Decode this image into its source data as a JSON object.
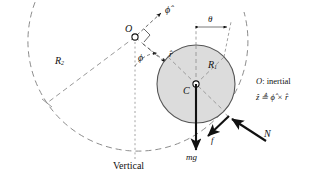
{
  "figure": {
    "type": "free-body-diagram",
    "background": "#ffffff",
    "ink": "#111111",
    "disk_fill": "#dcdcdc",
    "disk_stroke": "#555555",
    "dash_stroke": "#8c8c8c"
  },
  "points": {
    "O": {
      "label": "O",
      "x": 135,
      "y": 37,
      "note": "pivot / inertial origin"
    },
    "C": {
      "label": "C",
      "x": 196,
      "y": 84,
      "note": "disk center"
    },
    "contact": {
      "x": 229,
      "y": 117
    }
  },
  "geometry": {
    "big_arc": {
      "center_x": 135,
      "center_y": 37,
      "radius": 110
    },
    "disk": {
      "center_x": 196,
      "center_y": 84,
      "radius": 39
    }
  },
  "labels": {
    "O": "O",
    "C": "C",
    "R1": "R",
    "R1_sub": "1",
    "R2": "R",
    "R2_sub": "2",
    "phi_angle": "ϕ",
    "phi_hat": "ϕ̂",
    "r_hat": "r̂",
    "theta": "θ",
    "mg": "mg",
    "friction": "f",
    "normal": "N",
    "vertical": "Vertical"
  },
  "legend": {
    "line1_symbol": "O",
    "line1_text": ": inertial",
    "line2": "ẑ ≜ ϕ̂ × r̂"
  },
  "forces": [
    {
      "name": "weight",
      "symbol": "mg",
      "direction": "down",
      "from": [
        196,
        84
      ],
      "to": [
        196,
        152
      ]
    },
    {
      "name": "friction",
      "symbol": "f",
      "direction": "down-left",
      "from": [
        229,
        117
      ],
      "to": [
        206,
        138
      ]
    },
    {
      "name": "normal",
      "symbol": "N",
      "direction": "up-left",
      "from": [
        266,
        141
      ],
      "to": [
        231,
        119
      ]
    }
  ],
  "unit_vectors": [
    {
      "name": "phi-hat",
      "symbol": "ϕ̂",
      "from": [
        135,
        37
      ],
      "to": [
        163,
        11
      ]
    },
    {
      "name": "r-hat",
      "symbol": "r̂",
      "from": [
        142,
        44
      ],
      "to": [
        168,
        64
      ]
    }
  ]
}
